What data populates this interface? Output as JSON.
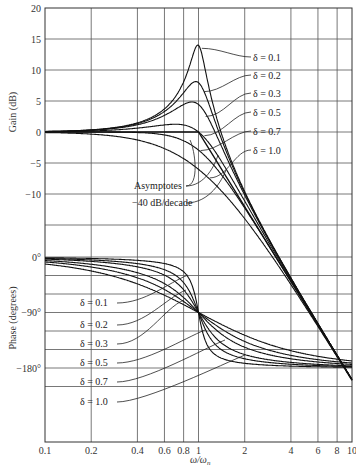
{
  "chart_data": [
    {
      "type": "line",
      "title": "",
      "xlabel": "ω/ωn",
      "ylabel": "Gain (dB)",
      "xscale": "log",
      "xlim": [
        0.1,
        10
      ],
      "ylim": [
        -15,
        20
      ],
      "x_ticks": [
        "0.1",
        "0.2",
        "0.4",
        "0.6",
        "0.8",
        "1",
        "2",
        "4",
        "6",
        "8",
        "10"
      ],
      "y_ticks": [
        "20",
        "15",
        "10",
        "5",
        "0",
        "-5",
        "-10"
      ],
      "grid": true,
      "series": [
        {
          "name": "δ = 0.1",
          "x": [
            0.1,
            0.5,
            0.8,
            1.0,
            2,
            10
          ],
          "values": [
            0.1,
            2.4,
            8.6,
            14.0,
            -9.4,
            -40.0
          ]
        },
        {
          "name": "δ = 0.2",
          "x": [
            0.1,
            0.5,
            0.8,
            1.0,
            2,
            10
          ],
          "values": [
            0.1,
            2.3,
            6.6,
            8.0,
            -9.7,
            -40.0
          ]
        },
        {
          "name": "δ = 0.3",
          "x": [
            0.1,
            0.5,
            0.8,
            1.0,
            2,
            10
          ],
          "values": [
            0.1,
            2.0,
            4.6,
            4.4,
            -10.1,
            -40.1
          ]
        },
        {
          "name": "δ = 0.5",
          "x": [
            0.1,
            0.5,
            0.8,
            1.0,
            2,
            10
          ],
          "values": [
            0.0,
            1.0,
            1.0,
            0.0,
            -11.1,
            -40.2
          ]
        },
        {
          "name": "δ = 0.7",
          "x": [
            0.1,
            0.5,
            0.8,
            1.0,
            2,
            10
          ],
          "values": [
            0.0,
            -0.2,
            -1.9,
            -2.9,
            -12.3,
            -40.3
          ]
        },
        {
          "name": "δ = 1.0",
          "x": [
            0.1,
            0.5,
            0.8,
            1.0,
            2,
            10
          ],
          "values": [
            -0.1,
            -1.9,
            -4.3,
            -6.0,
            -14.0,
            -40.1
          ]
        }
      ],
      "annotations": [
        "Asymptotes",
        "-40 dB/decade"
      ]
    },
    {
      "type": "line",
      "title": "",
      "xlabel": "ω/ωn",
      "ylabel": "Phase (degrees)",
      "xscale": "log",
      "xlim": [
        0.1,
        10
      ],
      "ylim": [
        -210,
        0
      ],
      "y_ticks": [
        "0°",
        "-90°",
        "-180°"
      ],
      "grid": true,
      "series": [
        {
          "name": "δ = 0.1",
          "x": [
            0.1,
            0.5,
            0.8,
            1.0,
            2,
            10
          ],
          "values": [
            -1.2,
            -7.6,
            -24.0,
            -90,
            -172.4,
            -178.8
          ]
        },
        {
          "name": "δ = 0.2",
          "x": [
            0.1,
            0.5,
            0.8,
            1.0,
            2,
            10
          ],
          "values": [
            -2.3,
            -14.9,
            -41.6,
            -90,
            -165.1,
            -177.7
          ]
        },
        {
          "name": "δ = 0.3",
          "x": [
            0.1,
            0.5,
            0.8,
            1.0,
            2,
            10
          ],
          "values": [
            -3.5,
            -21.8,
            -53.1,
            -90,
            -158.2,
            -176.5
          ]
        },
        {
          "name": "δ = 0.5",
          "x": [
            0.1,
            0.5,
            0.8,
            1.0,
            2,
            10
          ],
          "values": [
            -5.8,
            -33.7,
            -65.8,
            -90,
            -146.3,
            -174.2
          ]
        },
        {
          "name": "δ = 0.7",
          "x": [
            0.1,
            0.5,
            0.8,
            1.0,
            2,
            10
          ],
          "values": [
            -8.1,
            -43.0,
            -72.2,
            -90,
            -137.0,
            -171.9
          ]
        },
        {
          "name": "δ = 1.0",
          "x": [
            0.1,
            0.5,
            0.8,
            1.0,
            2,
            10
          ],
          "values": [
            -11.4,
            -53.1,
            -77.3,
            -90,
            -126.9,
            -168.6
          ]
        }
      ]
    }
  ],
  "labels": {
    "gain_axis_title": "Gain (dB)",
    "phase_axis_title": "Phase (degrees)",
    "x_axis_title_main": "ω/ω",
    "x_axis_title_sub": "n",
    "asymptotes": "Asymptotes",
    "slope": "40 dB/decade",
    "gain_legend": [
      "δ = 0.1",
      "δ = 0.2",
      "δ = 0.3",
      "δ = 0.5",
      "δ = 0.7",
      "δ = 1.0"
    ],
    "phase_legend": [
      "δ = 0.1",
      "δ = 0.2",
      "δ = 0.3",
      "δ = 0.5",
      "δ = 0.7",
      "δ = 1.0"
    ]
  },
  "gain_ticks": [
    "20",
    "15",
    "10",
    "5",
    "0",
    "-5",
    "-10"
  ],
  "phase_ticks": [
    "0°",
    "-90°",
    "-180°"
  ],
  "x_ticks": [
    "0.1",
    "0.2",
    "0.4",
    "0.6",
    "0.8",
    "1",
    "2",
    "4",
    "6",
    "8",
    "10"
  ],
  "deltas": [
    0.1,
    0.2,
    0.3,
    0.5,
    0.7,
    1.0
  ]
}
